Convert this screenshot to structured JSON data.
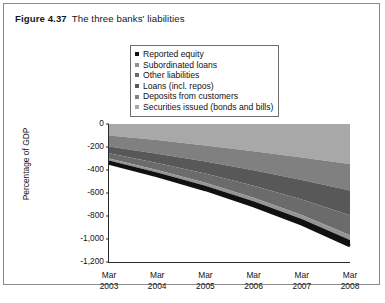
{
  "figure": {
    "label": "Figure 4.37",
    "caption": "The three banks' liabilities"
  },
  "legend": {
    "position": "top-center",
    "items": [
      {
        "label": "Reported equity",
        "color": "#111111"
      },
      {
        "label": "Subordinated loans",
        "color": "#949494"
      },
      {
        "label": "Other liabilities",
        "color": "#6b6b6b"
      },
      {
        "label": "Loans (incl. repos)",
        "color": "#585858"
      },
      {
        "label": "Deposits from customers",
        "color": "#808080"
      },
      {
        "label": "Securities issued (bonds and bills)",
        "color": "#a8a8a8"
      }
    ]
  },
  "axes": {
    "ylabel": "Percentage of GDP",
    "yticks": [
      "0",
      "-200",
      "-400",
      "-600",
      "-800",
      "-1,000",
      "-1,200"
    ],
    "ytick_values": [
      0,
      -200,
      -400,
      -600,
      -800,
      -1000,
      -1200
    ],
    "ylim": [
      -1200,
      0
    ],
    "xticks": [
      {
        "month": "Mar",
        "year": "2003"
      },
      {
        "month": "Mar",
        "year": "2004"
      },
      {
        "month": "Mar",
        "year": "2005"
      },
      {
        "month": "Mar",
        "year": "2006"
      },
      {
        "month": "Mar",
        "year": "2007"
      },
      {
        "month": "Mar",
        "year": "2008"
      }
    ],
    "grid": false
  },
  "footer": {
    "cut_off_text": "........ ... ......... ...... .. ........ .... .... ..... ......"
  },
  "chart_data": {
    "type": "area",
    "title": "The three banks' liabilities",
    "xlabel": "",
    "ylabel": "Percentage of GDP",
    "ylim": [
      -1200,
      0
    ],
    "grid": false,
    "stacked": true,
    "x": [
      "Mar 2003",
      "Mar 2004",
      "Mar 2005",
      "Mar 2006",
      "Mar 2007",
      "Mar 2008"
    ],
    "series": [
      {
        "name": "Reported equity",
        "color": "#111111",
        "values": [
          -22,
          -28,
          -33,
          -38,
          -44,
          -52
        ]
      },
      {
        "name": "Subordinated loans",
        "color": "#949494",
        "values": [
          -18,
          -22,
          -26,
          -30,
          -34,
          -40
        ]
      },
      {
        "name": "Other liabilities",
        "color": "#6b6b6b",
        "values": [
          -45,
          -62,
          -80,
          -105,
          -135,
          -175
        ]
      },
      {
        "name": "Loans (incl. repos)",
        "color": "#585858",
        "values": [
          -60,
          -80,
          -105,
          -135,
          -170,
          -215
        ]
      },
      {
        "name": "Deposits from customers",
        "color": "#808080",
        "values": [
          -95,
          -118,
          -140,
          -165,
          -195,
          -230
        ]
      },
      {
        "name": "Securities issued (bonds and bills)",
        "color": "#a8a8a8",
        "values": [
          -100,
          -140,
          -186,
          -237,
          -292,
          -348
        ]
      }
    ],
    "cumulative_total": [
      -340,
      -450,
      -570,
      -710,
      -870,
      -1060
    ],
    "note": "Negative stacked area descending from 0; total liabilities reach about -1,060% of GDP by Mar 2008"
  }
}
